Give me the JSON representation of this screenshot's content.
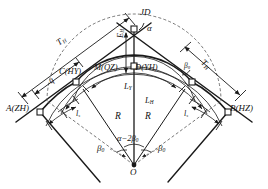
{
  "diagram": {
    "points": {
      "jd": "JD",
      "a_zh": "A(ZH)",
      "c_hy": "C(HY)",
      "m_qz": "M(QZ)",
      "d_yh": "D(YH)",
      "b_hz": "B(HZ)",
      "o": "O"
    },
    "angles": {
      "alpha": "α",
      "alpha_minus_2beta": "α−2β",
      "alpha_minus_2beta_sub": "0",
      "beta_left": "β",
      "beta_left_sub": "0",
      "beta_right": "β",
      "beta_right_sub": "0",
      "beta_small": "β",
      "beta_small_sub": "0"
    },
    "lengths": {
      "tangent_left": "T",
      "tangent_left_sub": "H",
      "tangent_right": "T",
      "tangent_right_sub": "H",
      "external": "E",
      "external_sub": "H",
      "curve_circular": "L",
      "curve_circular_sub": "Y",
      "curve_total": "L",
      "curve_total_sub": "H",
      "radius_left": "R",
      "radius_right": "R",
      "spiral_left": "l",
      "spiral_left_sub": "s",
      "spiral_right": "l",
      "spiral_right_sub": "s",
      "offset_q": "q"
    },
    "colors": {
      "line": "#1a1a1a",
      "dash": "#555555",
      "text": "#111111",
      "background": "#ffffff"
    }
  }
}
